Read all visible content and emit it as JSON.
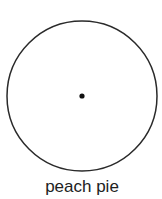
{
  "diagram": {
    "type": "circle-with-center-point",
    "circle": {
      "center_x": 82,
      "center_y": 96,
      "radius": 75,
      "stroke_color": "#2a2a2a",
      "stroke_width": 1.5,
      "fill": "#ffffff"
    },
    "center_point": {
      "x": 82,
      "y": 96,
      "radius": 2.6,
      "color": "#111111"
    },
    "caption": "peach pie"
  }
}
